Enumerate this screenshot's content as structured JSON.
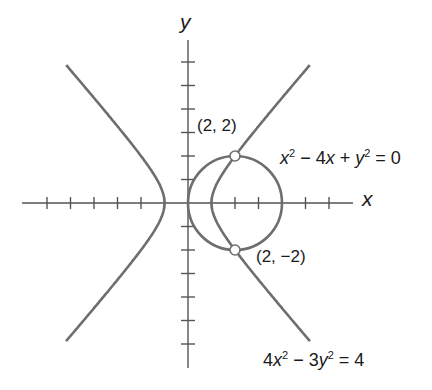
{
  "axes": {
    "x_label": "x",
    "y_label": "y",
    "unit_px": 23.5,
    "origin_px": [
      188,
      203
    ]
  },
  "curves": [
    {
      "name": "circle",
      "equation_parts": [
        "x",
        "2",
        " − 4",
        "x",
        " + ",
        "y",
        "2",
        " = 0"
      ],
      "center": [
        2,
        0
      ],
      "radius": 2
    },
    {
      "name": "hyperbola",
      "equation_parts": [
        "4",
        "x",
        "2",
        " − 3",
        "y",
        "2",
        " = 4"
      ]
    }
  ],
  "points": [
    {
      "label": "(2, 2)",
      "x": 2,
      "y": 2
    },
    {
      "label": "(2, −2)",
      "x": 2,
      "y": -2
    }
  ],
  "colors": {
    "curve": "#6e6e6e",
    "axis": "#555555",
    "text": "#1a1a1a"
  }
}
